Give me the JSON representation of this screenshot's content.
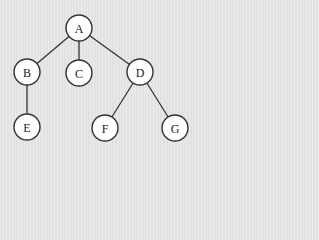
{
  "diagram": {
    "type": "tree",
    "background": "#e7e7e7",
    "node_fill": "#ffffff",
    "stroke_color": "#333333",
    "nodes": [
      {
        "id": "A",
        "label": "A",
        "x": 79,
        "y": 28
      },
      {
        "id": "B",
        "label": "B",
        "x": 27,
        "y": 72
      },
      {
        "id": "C",
        "label": "C",
        "x": 79,
        "y": 73
      },
      {
        "id": "D",
        "label": "D",
        "x": 140,
        "y": 72
      },
      {
        "id": "E",
        "label": "E",
        "x": 27,
        "y": 127
      },
      {
        "id": "F",
        "label": "F",
        "x": 105,
        "y": 128
      },
      {
        "id": "G",
        "label": "G",
        "x": 175,
        "y": 128
      }
    ],
    "edges": [
      {
        "from": "A",
        "to": "B"
      },
      {
        "from": "A",
        "to": "C"
      },
      {
        "from": "A",
        "to": "D"
      },
      {
        "from": "B",
        "to": "E"
      },
      {
        "from": "D",
        "to": "F"
      },
      {
        "from": "D",
        "to": "G"
      }
    ]
  }
}
